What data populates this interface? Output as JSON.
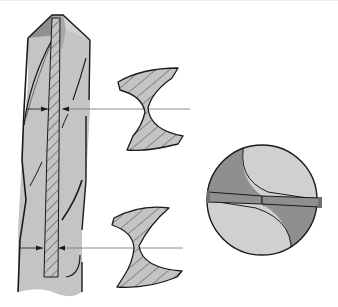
{
  "diagram": {
    "labels": [],
    "colors": {
      "background": "#ffffff",
      "body_gray": "#c4c4c4",
      "dark_gray": "#8f8f8f",
      "light_gray": "#d2d2d2",
      "outline": "#1a1a1a",
      "hatch": "#3a3a3a",
      "leader_line": "#6e6e6e"
    },
    "parts": [
      {
        "id": "drill-side-view",
        "description": "Side view of twist drill with hatched web core"
      },
      {
        "id": "section-upper",
        "description": "Cross-section near tip showing thin web"
      },
      {
        "id": "section-lower",
        "description": "Cross-section near shank showing thicker web"
      },
      {
        "id": "end-view",
        "description": "End view of drill point"
      }
    ],
    "dimension_markers": [
      {
        "id": "web-upper",
        "y": 109
      },
      {
        "id": "web-lower",
        "y": 248
      }
    ]
  }
}
